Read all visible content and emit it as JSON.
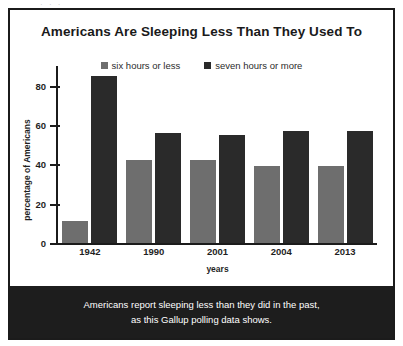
{
  "top_bleed": "· · ·",
  "figure": {
    "caption_lines": [
      "Americans report sleeping less than they did in the past,",
      "as this Gallup polling data shows."
    ]
  },
  "colors": {
    "six_hours_or_less": "#6e6e6e",
    "seven_hours_or_more": "#2a2a2a",
    "axis": "#1b1b1b",
    "banner_background": "#1d1d1d",
    "banner_text": "#ffffff"
  },
  "chart_data": {
    "type": "bar",
    "title": "Americans Are Sleeping Less Than They Used To",
    "xlabel": "years",
    "ylabel": "percentage of Americans",
    "categories": [
      "1942",
      "1990",
      "2001",
      "2004",
      "2013"
    ],
    "series": [
      {
        "name": "six hours or less",
        "color": "#6e6e6e",
        "values": [
          11,
          42,
          42,
          39,
          39
        ]
      },
      {
        "name": "seven hours or more",
        "color": "#2a2a2a",
        "values": [
          85,
          56,
          55,
          57,
          57
        ]
      }
    ],
    "ylim": [
      0,
      90
    ],
    "yticks": [
      0,
      20,
      40,
      60,
      80
    ],
    "ytick_labels": [
      "0",
      "20",
      "40",
      "60",
      "80"
    ],
    "grid": false,
    "legend_position": "top-center"
  }
}
